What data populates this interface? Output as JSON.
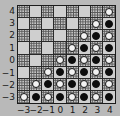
{
  "chart_data": {
    "type": "heatmap",
    "title": "",
    "subtitle": "",
    "xlabel": "",
    "ylabel": "",
    "grid": true,
    "legend": null,
    "x": [
      -3,
      -2,
      -1,
      0,
      1,
      2,
      3,
      4
    ],
    "y": [
      -3,
      -2,
      -1,
      0,
      1,
      2,
      3,
      4
    ],
    "xtick_labels": [
      "−3",
      "−2",
      "−1",
      "0",
      "1",
      "2",
      "3",
      "4"
    ],
    "ytick_labels": [
      "4",
      "3",
      "2",
      "1",
      "0",
      "−1",
      "−2",
      "−3"
    ],
    "xlim": [
      -3.5,
      4.5
    ],
    "ylim": [
      -3.5,
      4.5
    ],
    "cell_kinds": [
      "plain",
      "dotted",
      "open-circle",
      "filled-circle"
    ],
    "rows_top_to_bottom": [
      {
        "y": 4,
        "cells": [
          "dotted",
          "plain",
          "dotted",
          "plain",
          "dotted",
          "plain",
          "dotted",
          "open-circle"
        ]
      },
      {
        "y": 3,
        "cells": [
          "plain",
          "dotted",
          "plain",
          "dotted",
          "plain",
          "dotted",
          "open-circle",
          "filled-circle"
        ]
      },
      {
        "y": 2,
        "cells": [
          "dotted",
          "plain",
          "dotted",
          "plain",
          "dotted",
          "open-circle",
          "filled-circle",
          "open-circle"
        ]
      },
      {
        "y": 1,
        "cells": [
          "plain",
          "dotted",
          "plain",
          "dotted",
          "open-circle",
          "filled-circle",
          "open-circle",
          "filled-circle"
        ]
      },
      {
        "y": 0,
        "cells": [
          "dotted",
          "plain",
          "dotted",
          "open-circle",
          "filled-circle",
          "open-circle",
          "filled-circle",
          "open-circle"
        ]
      },
      {
        "y": -1,
        "cells": [
          "plain",
          "dotted",
          "open-circle",
          "filled-circle",
          "open-circle",
          "filled-circle",
          "open-circle",
          "filled-circle"
        ]
      },
      {
        "y": -2,
        "cells": [
          "dotted",
          "open-circle",
          "filled-circle",
          "open-circle",
          "filled-circle",
          "open-circle",
          "filled-circle",
          "open-circle"
        ]
      },
      {
        "y": -3,
        "cells": [
          "open-circle",
          "filled-circle",
          "open-circle",
          "filled-circle",
          "open-circle",
          "filled-circle",
          "open-circle",
          "filled-circle"
        ]
      }
    ],
    "colors": {
      "plain_fill": "#cfcfcf",
      "dotted_fill": "#c4c4c4",
      "dot_color": "#5a5a5a",
      "open_marker_face": "#f2f2f2",
      "marker_edge": "#141414",
      "filled_marker_face": "#0d0d0d",
      "gridline": "#2a2a2a",
      "frame": "#1c1c1c",
      "background": "#b9b9b9",
      "tick_label": "#1a1a1a"
    }
  }
}
